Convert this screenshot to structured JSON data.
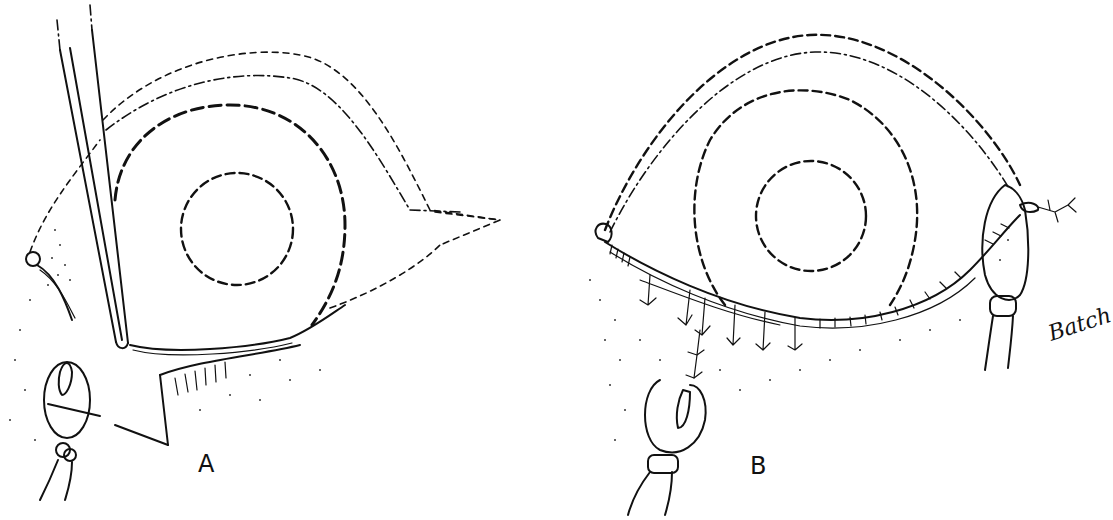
{
  "figure": {
    "panels": [
      {
        "id": "A",
        "label": "A",
        "description": "Lower eyelid retracted with forceps, lid margin divided, clamp applied at medial end"
      },
      {
        "id": "B",
        "label": "B",
        "description": "Lower eyelid margin sutured along its length, clamps applied at medial and lateral ends"
      }
    ],
    "signature": "Batch",
    "colors": {
      "ink": "#111111",
      "background": "#ffffff"
    }
  }
}
